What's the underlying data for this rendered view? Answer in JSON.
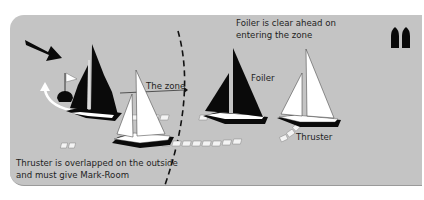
{
  "diagram": {
    "title_note": {
      "line1": "Foiler is clear ahead on",
      "line2": "entering the zone"
    },
    "bottom_note": {
      "line1": "Thruster is overlapped on the outside",
      "line2": "and must give Mark-Room"
    },
    "labels": {
      "zone": "The zone",
      "foiler": "Foiler",
      "thruster": "Thruster"
    },
    "icons": [
      "wind-arrow-icon",
      "mark-flag-icon",
      "rounding-arrow-icon",
      "boat-symbols-icon"
    ],
    "colors": {
      "background_panel": "#c4c4c4",
      "foiler_boat": "#0a0a0a",
      "thruster_boat": "#ffffff",
      "text": "#1e1e1e"
    }
  }
}
